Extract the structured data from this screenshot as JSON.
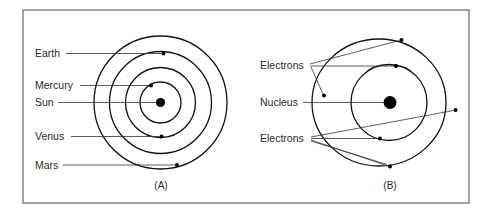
{
  "figure": {
    "frame_color": "#666666"
  },
  "panel_a": {
    "caption": "(A)",
    "labels": {
      "earth": "Earth",
      "mercury": "Mercury",
      "sun": "Sun",
      "venus": "Venus",
      "mars": "Mars"
    }
  },
  "panel_b": {
    "caption": "(B)",
    "labels": {
      "electrons_top": "Electrons",
      "nucleus": "Nucleus",
      "electrons_bottom": "Electrons"
    }
  }
}
